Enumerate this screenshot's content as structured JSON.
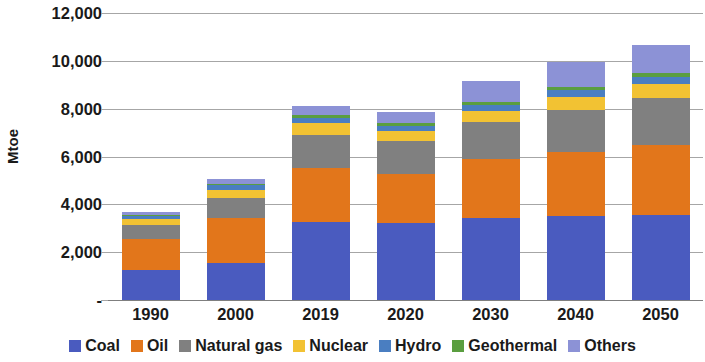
{
  "chart_data": {
    "type": "bar",
    "title": "",
    "subtitle": "",
    "xlabel": "",
    "ylabel": "Mtoe",
    "stacked": true,
    "grid": true,
    "legend_position": "bottom",
    "ylim": [
      0,
      12000
    ],
    "yticks": [
      "-",
      "2,000",
      "4,000",
      "6,000",
      "8,000",
      "10,000",
      "12,000"
    ],
    "ytick_values": [
      0,
      2000,
      4000,
      6000,
      8000,
      10000,
      12000
    ],
    "categories": [
      "1990",
      "2000",
      "2019",
      "2020",
      "2030",
      "2040",
      "2050"
    ],
    "series": [
      {
        "name": "Coal",
        "color": "#4a5bbf",
        "values": [
          1250,
          1560,
          3270,
          3230,
          3450,
          3500,
          3570
        ]
      },
      {
        "name": "Oil",
        "color": "#e2761b",
        "values": [
          1300,
          1880,
          2230,
          2020,
          2450,
          2700,
          2920
        ]
      },
      {
        "name": "Natural gas",
        "color": "#808080",
        "values": [
          600,
          820,
          1400,
          1400,
          1550,
          1750,
          1950
        ]
      },
      {
        "name": "Nuclear",
        "color": "#f2c233",
        "values": [
          230,
          360,
          500,
          400,
          450,
          550,
          600
        ]
      },
      {
        "name": "Hydro",
        "color": "#4a7ec1",
        "values": [
          130,
          170,
          220,
          230,
          250,
          270,
          290
        ]
      },
      {
        "name": "Geothermal",
        "color": "#5a9e3f",
        "values": [
          60,
          80,
          110,
          110,
          130,
          150,
          170
        ]
      },
      {
        "name": "Others",
        "color": "#8c92d6",
        "values": [
          130,
          180,
          370,
          460,
          870,
          1030,
          1150
        ]
      }
    ],
    "totals": [
      3700,
      5050,
      8100,
      7850,
      9150,
      9950,
      10650
    ]
  },
  "axis": {
    "y_title": "Mtoe"
  },
  "legend": {
    "items": [
      {
        "label": "Coal"
      },
      {
        "label": "Oil"
      },
      {
        "label": "Natural gas"
      },
      {
        "label": "Nuclear"
      },
      {
        "label": "Hydro"
      },
      {
        "label": "Geothermal"
      },
      {
        "label": "Others"
      }
    ]
  }
}
